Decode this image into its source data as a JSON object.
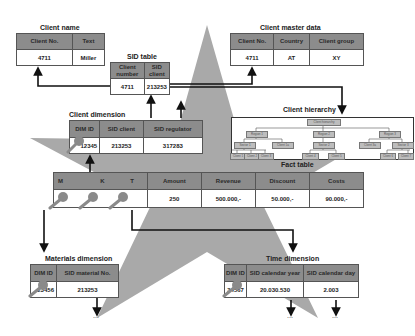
{
  "client_name": {
    "title": "Client name",
    "headers": [
      "Client No.",
      "Text"
    ],
    "row": [
      "4711",
      "Miller"
    ]
  },
  "sid_table": {
    "title": "SID table",
    "headers": [
      "Client number",
      "SID client"
    ],
    "row": [
      "4711",
      "213253"
    ]
  },
  "client_master": {
    "title": "Client master data",
    "headers": [
      "Client No.",
      "Country",
      "Client group"
    ],
    "row": [
      "4711",
      "AT",
      "XY"
    ]
  },
  "client_hierarchy": {
    "title": "Client hierarchy",
    "root": "Client hierarchy",
    "level1": [
      "Region 1",
      "Region 2",
      "Region 3"
    ],
    "level2": [
      "Sector 1",
      "Client 1a",
      "Sector 2",
      "Client 3a",
      "Sector 3"
    ],
    "level3": [
      "Client 1",
      "Client 2",
      "Client 3",
      "Client 4",
      "Client 5",
      "Client 6",
      "Client 7"
    ]
  },
  "client_dimension": {
    "title": "Client dimension",
    "headers": [
      "DIM ID",
      "SID client",
      "SID regulator"
    ],
    "row": [
      "12345",
      "213253",
      "317283"
    ]
  },
  "fact_table": {
    "title": "Fact table",
    "headers": [
      "M",
      "K",
      "T",
      "Amount",
      "Revenue",
      "Discount",
      "Costs"
    ],
    "row": [
      "",
      "",
      "",
      "250",
      "500.000,-",
      "50.000,-",
      "90.000,-"
    ]
  },
  "materials_dimension": {
    "title": "Materials dimension",
    "headers": [
      "DIM ID",
      "SID material No."
    ],
    "row": [
      "23456",
      "213253"
    ]
  },
  "time_dimension": {
    "title": "Time dimension",
    "headers": [
      "DIM ID",
      "SID calendar year",
      "SID calendar day"
    ],
    "row": [
      "34567",
      "20.030.530",
      "2.003"
    ]
  },
  "ellipsis": "...",
  "colors": {
    "star": "#a9a9a9",
    "header": "#8c8c8c",
    "key": "#8a8a8a"
  }
}
